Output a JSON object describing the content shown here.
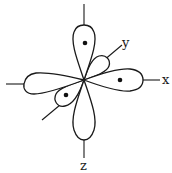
{
  "diagram": {
    "type": "orbital-lobe-diagram",
    "axes": {
      "x": {
        "label": "x"
      },
      "y": {
        "label": "y"
      },
      "z": {
        "label": "z"
      }
    },
    "lobes": [
      {
        "direction": "up",
        "has_dot": true
      },
      {
        "direction": "right",
        "has_dot": true
      },
      {
        "direction": "down",
        "has_dot": false
      },
      {
        "direction": "left",
        "has_dot": false
      },
      {
        "direction": "upper-right-small",
        "has_dot": false
      },
      {
        "direction": "lower-left-small",
        "has_dot": true
      }
    ],
    "colors": {
      "stroke": "#1a1a1a",
      "fill": "#ffffff"
    }
  }
}
